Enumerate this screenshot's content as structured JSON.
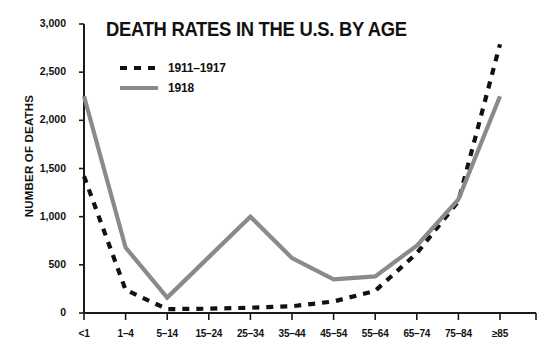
{
  "chart_data": {
    "type": "line",
    "title": "DEATH RATES IN THE U.S. BY AGE",
    "xlabel": "",
    "ylabel": "NUMBER OF DEATHS",
    "categories": [
      "<1",
      "1–4",
      "5–14",
      "15–24",
      "25–34",
      "35–44",
      "45–54",
      "55–64",
      "65–74",
      "75–84",
      "≥85"
    ],
    "ylim": [
      0,
      3000
    ],
    "ytick_values": [
      0,
      500,
      1000,
      1500,
      2000,
      2500,
      3000
    ],
    "ytick_labels": [
      "0",
      "500",
      "1,000",
      "1,500",
      "2,000",
      "2,500",
      "3,000"
    ],
    "grid": false,
    "legend_position": "top-left-inside",
    "series": [
      {
        "name": "1911–1917",
        "style": "dashed",
        "color": "#111111",
        "values": [
          1420,
          240,
          40,
          45,
          55,
          70,
          120,
          230,
          620,
          1160,
          2790
        ]
      },
      {
        "name": "1918",
        "style": "solid",
        "color": "#8a8a8a",
        "values": [
          2250,
          680,
          160,
          580,
          1000,
          570,
          350,
          380,
          700,
          1180,
          2250
        ]
      }
    ]
  },
  "colors": {
    "series_1911_1917": "#111111",
    "series_1918": "#8a8a8a",
    "axis": "#1a1a1a",
    "background": "#ffffff",
    "text": "#111111"
  }
}
